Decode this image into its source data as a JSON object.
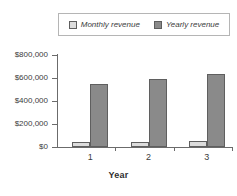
{
  "chart_data": {
    "type": "bar",
    "title": "",
    "xlabel": "Year",
    "ylabel": "",
    "categories": [
      "1",
      "2",
      "3"
    ],
    "series": [
      {
        "name": "Monthly revenue",
        "values": [
          40000,
          47000,
          55000
        ],
        "color": "#dcdcdc"
      },
      {
        "name": "Yearly revenue",
        "values": [
          550000,
          595000,
          635000
        ],
        "color": "#8a8a8a"
      }
    ],
    "ylim": [
      0,
      800000
    ],
    "ytick_values": [
      800000,
      600000,
      400000,
      200000,
      0
    ],
    "ytick_labels": [
      "$800,000",
      "$600,000",
      "$400,000",
      "$200,000",
      "$0"
    ],
    "grid": false,
    "legend_position": "top-center"
  },
  "legend": {
    "entries": [
      {
        "label": "Monthly revenue",
        "swatch": "light-gray-square"
      },
      {
        "label": "Yearly revenue",
        "swatch": "dark-gray-square"
      }
    ]
  },
  "axes": {
    "x_title": "Year",
    "x_labels": [
      "1",
      "2",
      "3"
    ],
    "y_labels": [
      "$800,000",
      "$600,000",
      "$400,000",
      "$200,000",
      "$0"
    ]
  },
  "colors": {
    "monthly": "#dcdcdc",
    "yearly": "#8a8a8a",
    "axis": "#6b6b6b",
    "text": "#3c3c3c",
    "background": "#ffffff"
  }
}
